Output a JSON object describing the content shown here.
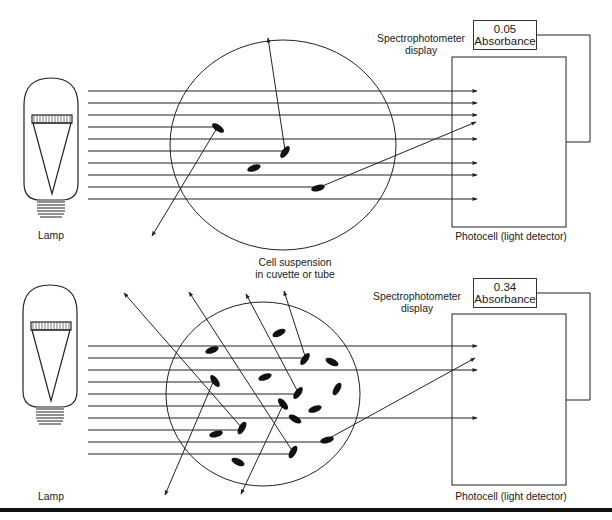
{
  "diagram": {
    "colors": {
      "line": "#222222",
      "cell": "#111111",
      "background": "#ffffff",
      "rule": "#111111"
    },
    "shared_labels": {
      "cuvette": "Cell suspension\nin cuvette or tube",
      "cuvette_line1": "Cell suspension",
      "cuvette_line2": "in cuvette or tube"
    },
    "panels": [
      {
        "id": "top",
        "description": "Dilute suspension - few cells, little scattering",
        "lamp_label": "Lamp",
        "display_label_line1": "Spectrophotometer",
        "display_label_line2": "display",
        "display_value": "0.05",
        "display_unit": "Absorbance",
        "detector_label": "Photocell (light detector)",
        "cell_count": 4,
        "absorbance": 0.05
      },
      {
        "id": "bottom",
        "description": "Dense suspension - many cells, much scattering",
        "lamp_label": "Lamp",
        "display_label_line1": "Spectrophotometer",
        "display_label_line2": "display",
        "display_value": "0.34",
        "display_unit": "Absorbance",
        "detector_label": "Photocell (light detector)",
        "cell_count": 16,
        "absorbance": 0.34
      }
    ]
  }
}
